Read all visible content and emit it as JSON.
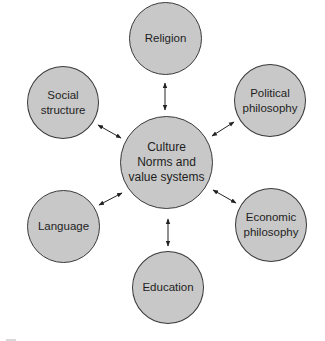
{
  "diagram": {
    "type": "hub-and-spoke",
    "central": {
      "lines": [
        "Culture",
        "Norms and",
        "value systems"
      ]
    },
    "nodes": [
      {
        "id": "religion",
        "lines": [
          "Religion"
        ]
      },
      {
        "id": "social-structure",
        "lines": [
          "Social",
          "structure"
        ]
      },
      {
        "id": "political-philosophy",
        "lines": [
          "Political",
          "philosophy"
        ]
      },
      {
        "id": "language",
        "lines": [
          "Language"
        ]
      },
      {
        "id": "economic-philosophy",
        "lines": [
          "Economic",
          "philosophy"
        ]
      },
      {
        "id": "education",
        "lines": [
          "Education"
        ]
      }
    ],
    "edges": [
      {
        "from": "central",
        "to": "religion",
        "style": "bidirectional-arrow"
      },
      {
        "from": "central",
        "to": "social-structure",
        "style": "bidirectional-arrow"
      },
      {
        "from": "central",
        "to": "political-philosophy",
        "style": "bidirectional-arrow"
      },
      {
        "from": "central",
        "to": "language",
        "style": "bidirectional-arrow"
      },
      {
        "from": "central",
        "to": "economic-philosophy",
        "style": "bidirectional-arrow"
      },
      {
        "from": "central",
        "to": "education",
        "style": "bidirectional-arrow"
      }
    ],
    "colors": {
      "node_fill": "#c8c8c8",
      "node_stroke": "#3a3a3a",
      "arrow": "#222222",
      "text": "#1e1e1e"
    }
  }
}
